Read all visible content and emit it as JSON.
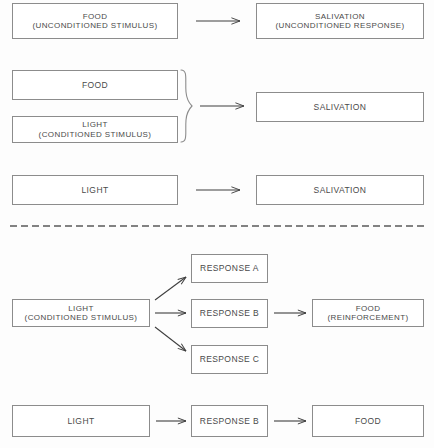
{
  "diagram": {
    "colors": {
      "box_border": "#8c8c8c",
      "text": "#4a4a4a",
      "arrow": "#3f3f3f",
      "divider": "#5a5a5a",
      "background": "#fdfdfd"
    },
    "sections": {
      "classical": {
        "rows": [
          {
            "name": "unconditioned-reflex",
            "stimulus": {
              "line1": "FOOD",
              "line2": "(UNCONDITIONED STIMULUS)"
            },
            "arrow": "arrow-right",
            "response": {
              "line1": "SALIVATION",
              "line2": "(UNCONDITIONED RESPONSE)"
            }
          },
          {
            "name": "pairing",
            "stimulus_top": {
              "line1": "FOOD",
              "line2": ""
            },
            "stimulus_bottom": {
              "line1": "LIGHT",
              "line2": "(CONDITIONED STIMULUS)"
            },
            "brace": "right-curly-brace",
            "arrow": "arrow-right",
            "response": {
              "line1": "SALIVATION",
              "line2": ""
            }
          },
          {
            "name": "conditioned-reflex",
            "stimulus": {
              "line1": "LIGHT",
              "line2": ""
            },
            "arrow": "arrow-right",
            "response": {
              "line1": "SALIVATION",
              "line2": ""
            }
          }
        ]
      },
      "divider": {
        "name": "dashed-divider",
        "style": "dashed"
      },
      "operant": {
        "rows": [
          {
            "name": "response-fan",
            "stimulus": {
              "line1": "LIGHT",
              "line2": "(CONDITIONED STIMULUS)"
            },
            "responses": [
              {
                "label": "RESPONSE A",
                "arrow": "arrow-up-right"
              },
              {
                "label": "RESPONSE B",
                "arrow": "arrow-right"
              },
              {
                "label": "RESPONSE C",
                "arrow": "arrow-down-right"
              }
            ],
            "arrow_to_outcome": "arrow-right",
            "outcome": {
              "line1": "FOOD",
              "line2": "(REINFORCEMENT)"
            }
          },
          {
            "name": "learned-chain",
            "stimulus": {
              "line1": "LIGHT",
              "line2": ""
            },
            "arrow_1": "arrow-right",
            "response": {
              "line1": "RESPONSE B",
              "line2": ""
            },
            "arrow_2": "arrow-right",
            "outcome": {
              "line1": "FOOD",
              "line2": ""
            }
          }
        ]
      }
    }
  }
}
